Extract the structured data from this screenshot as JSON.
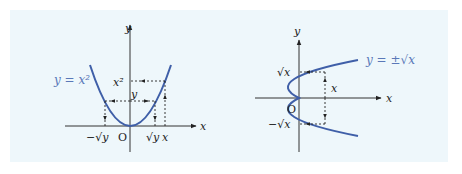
{
  "figure": {
    "background_color": "#eef7fb",
    "curve_color": "#3f5fa8",
    "label_color": "#5a78b8",
    "axis_color": "#333333"
  },
  "left_graph": {
    "curve_label": "y = x²",
    "axis_x_label": "x",
    "axis_y_label": "y",
    "origin_label": "O",
    "level_x2_label": "x²",
    "level_y_label": "y",
    "tick_neg_sqrt_y": "−√y",
    "tick_sqrt_y": "√y",
    "tick_x": "x"
  },
  "right_graph": {
    "curve_label": "y = ±√x",
    "axis_x_label": "x",
    "axis_y_label": "y",
    "origin_label": "O",
    "level_sqrt_x": "√x",
    "level_neg_sqrt_x": "−√x",
    "distance_label": "x"
  }
}
